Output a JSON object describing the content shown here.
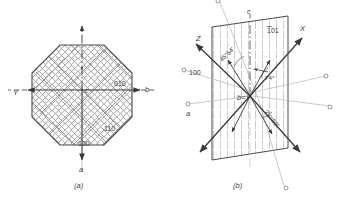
{
  "figure": {
    "colors": {
      "line": "#3a3a3a",
      "hatch": "#8c8c8c",
      "faint": "#b0b0b0",
      "background": "#ffffff"
    },
    "panels": [
      {
        "id": "a",
        "caption": "(a)",
        "description": "Plan view of octagonal crystal section with crosshatched lamellae",
        "center_label": "c",
        "axes": [
          {
            "name": "axis-b",
            "label": "b",
            "direction": "right"
          },
          {
            "name": "axis-Y",
            "label": "Y",
            "direction": "left"
          },
          {
            "name": "axis-a",
            "label": "a",
            "direction": "down"
          }
        ],
        "face_labels": [
          {
            "name": "face-010",
            "label": "010"
          },
          {
            "name": "face-110",
            "label": "110"
          },
          {
            "name": "face-100",
            "label": "100"
          }
        ]
      },
      {
        "id": "b",
        "caption": "(b)",
        "description": "Optic axial plane stereogram with X, Y, Z optical directions",
        "center_label": "b=Y",
        "axes": [
          {
            "name": "axis-X",
            "label": "X"
          },
          {
            "name": "axis-Z",
            "label": "Z"
          },
          {
            "name": "axis-c",
            "label": "c"
          },
          {
            "name": "axis-a",
            "label": "a"
          }
        ],
        "face_labels": [
          {
            "name": "face-100",
            "label": "100"
          },
          {
            "name": "face-1bar01",
            "label": "101",
            "overbar_first": true
          }
        ],
        "angles": [
          {
            "name": "angle-45-54",
            "label": "45°54'"
          },
          {
            "name": "angle-74",
            "label": "74°"
          },
          {
            "name": "angle-2v-60",
            "label": "2V=60°"
          }
        ]
      }
    ]
  }
}
